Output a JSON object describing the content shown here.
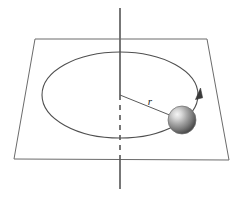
{
  "figure": {
    "width": 239,
    "height": 204,
    "background_color": "#ffffff",
    "labels": {
      "radius": "r"
    },
    "colors": {
      "stroke": "#4a4a4a",
      "axis_stroke": "#555555",
      "plane_stroke": "#6b6b6b",
      "circle_stroke": "#4f4f4f",
      "radius_stroke": "#5a5a5a",
      "sphere_light": "#f2f2f2",
      "sphere_mid": "#9a9a9a",
      "sphere_dark": "#4c4c4c",
      "label_color": "#1a1a1a"
    },
    "elements": {
      "vertical_axis": {
        "name": "rotation axis",
        "x": 120,
        "top_y": 8,
        "bottom_y": 189,
        "solid_upper_end_y": 95,
        "dashed_end_y": 155,
        "style": "solid-above-plane, dashed-behind-plane"
      },
      "plane": {
        "name": "horizontal plane",
        "corners": [
          {
            "x": 35,
            "y": 39
          },
          {
            "x": 207,
            "y": 39
          },
          {
            "x": 229,
            "y": 160
          },
          {
            "x": 14,
            "y": 159
          }
        ],
        "fill": "none"
      },
      "circle_path": {
        "name": "circular orbit",
        "center_x": 120,
        "center_y": 95,
        "rx": 78,
        "ry": 43,
        "style": "ellipse (circle in perspective)"
      },
      "radius_line": {
        "name": "radius r",
        "from_x": 120,
        "from_y": 95,
        "to_x": 176,
        "to_y": 118,
        "label": "r",
        "label_x": 150,
        "label_y": 104
      },
      "sphere": {
        "name": "ball",
        "center_x": 182,
        "center_y": 120,
        "radius": 14,
        "highlight_offset_x": -5,
        "highlight_offset_y": -5
      },
      "direction_arrow": {
        "name": "direction of motion",
        "tip_x": 198,
        "tip_y": 90,
        "points_direction": "upward along orbit"
      }
    }
  }
}
